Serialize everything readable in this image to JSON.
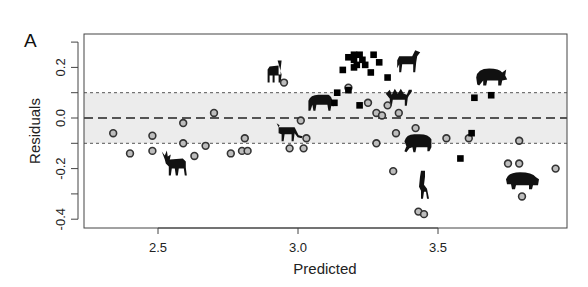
{
  "panel_label": "A",
  "chart_data": {
    "type": "scatter",
    "title": "",
    "xlabel": "Predicted",
    "ylabel": "Residuals",
    "xlim": [
      2.28,
      4.0
    ],
    "ylim": [
      -0.44,
      0.33
    ],
    "x_ticks": [
      2.5,
      3.0,
      3.5
    ],
    "x_tick_labels": [
      "2.5",
      "3.0",
      "3.5"
    ],
    "y_ticks": [
      -0.4,
      -0.3,
      -0.2,
      -0.1,
      0.0,
      0.1,
      0.2,
      0.3
    ],
    "y_tick_labels": [
      "-0.4",
      "",
      "-0.2",
      "",
      "0.0",
      "",
      "0.2",
      ""
    ],
    "grid": false,
    "reference_lines": {
      "zero_line": {
        "y": 0.0,
        "style": "long-dash"
      },
      "band": {
        "ymin": -0.1,
        "ymax": 0.1,
        "fill": "#ececec",
        "edge_style": "short-dash"
      }
    },
    "series": [
      {
        "name": "circles",
        "marker": "open-circle",
        "color": "#333333",
        "fill": "#bdbdbd",
        "points": [
          [
            2.34,
            -0.06
          ],
          [
            2.4,
            -0.14
          ],
          [
            2.48,
            -0.07
          ],
          [
            2.48,
            -0.13
          ],
          [
            2.59,
            -0.02
          ],
          [
            2.59,
            -0.1
          ],
          [
            2.63,
            -0.15
          ],
          [
            2.67,
            -0.11
          ],
          [
            2.7,
            0.02
          ],
          [
            2.76,
            -0.14
          ],
          [
            2.8,
            -0.13
          ],
          [
            2.82,
            -0.13
          ],
          [
            2.81,
            -0.08
          ],
          [
            2.95,
            0.14
          ],
          [
            2.97,
            -0.12
          ],
          [
            3.02,
            -0.12
          ],
          [
            3.01,
            -0.01
          ],
          [
            3.03,
            -0.08
          ],
          [
            3.18,
            0.12
          ],
          [
            3.25,
            0.06
          ],
          [
            3.28,
            0.02
          ],
          [
            3.28,
            -0.1
          ],
          [
            3.3,
            0.01
          ],
          [
            3.32,
            0.05
          ],
          [
            3.34,
            -0.21
          ],
          [
            3.35,
            -0.06
          ],
          [
            3.36,
            0.02
          ],
          [
            3.42,
            -0.04
          ],
          [
            3.43,
            -0.37
          ],
          [
            3.45,
            -0.38
          ],
          [
            3.53,
            -0.08
          ],
          [
            3.61,
            -0.08
          ],
          [
            3.75,
            -0.18
          ],
          [
            3.79,
            -0.18
          ],
          [
            3.79,
            -0.09
          ],
          [
            3.8,
            -0.31
          ],
          [
            3.92,
            -0.2
          ]
        ]
      },
      {
        "name": "squares",
        "marker": "filled-square",
        "color": "#000000",
        "points": [
          [
            3.13,
            0.06
          ],
          [
            3.14,
            0.1
          ],
          [
            3.16,
            0.19
          ],
          [
            3.18,
            0.11
          ],
          [
            3.18,
            0.24
          ],
          [
            3.2,
            0.25
          ],
          [
            3.2,
            0.23
          ],
          [
            3.2,
            0.2
          ],
          [
            3.21,
            0.21
          ],
          [
            3.22,
            0.25
          ],
          [
            3.22,
            0.05
          ],
          [
            3.23,
            0.23
          ],
          [
            3.24,
            0.21
          ],
          [
            3.26,
            0.18
          ],
          [
            3.27,
            0.25
          ],
          [
            3.29,
            0.22
          ],
          [
            3.32,
            0.16
          ],
          [
            3.58,
            -0.16
          ],
          [
            3.62,
            -0.06
          ],
          [
            3.63,
            0.08
          ],
          [
            3.69,
            0.09
          ]
        ]
      }
    ],
    "annotations": [
      {
        "icon": "moose",
        "x": 2.56,
        "y": -0.18
      },
      {
        "icon": "llama",
        "x": 2.92,
        "y": 0.18
      },
      {
        "icon": "gazelle",
        "x": 2.97,
        "y": -0.06
      },
      {
        "icon": "tapir",
        "x": 3.08,
        "y": 0.06
      },
      {
        "icon": "zebra",
        "x": 3.39,
        "y": 0.22
      },
      {
        "icon": "camel",
        "x": 3.36,
        "y": 0.08
      },
      {
        "icon": "bison",
        "x": 3.43,
        "y": -0.1
      },
      {
        "icon": "giraffe",
        "x": 3.45,
        "y": -0.28
      },
      {
        "icon": "rhino",
        "x": 3.69,
        "y": 0.16
      },
      {
        "icon": "hippo",
        "x": 3.8,
        "y": -0.25
      }
    ]
  }
}
